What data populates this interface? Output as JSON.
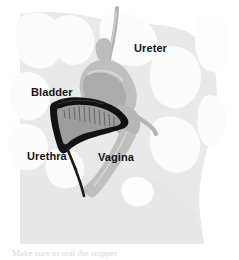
{
  "figure": {
    "name": "female-pelvic-anatomy-sagittal",
    "caption_partial": "Make sure to seal the stopper"
  },
  "labels": {
    "ureter": "Ureter",
    "bladder": "Bladder",
    "urethra": "Urethra",
    "vagina": "Vagina"
  },
  "colors": {
    "page_background": "#ffffff",
    "body_tissue": "#e8e8e8",
    "bone_light": "#f4f4f4",
    "organ_gray": "#bdbdbd",
    "organ_gray_dark": "#a8a8a8",
    "bladder_outline": "#111111",
    "bladder_lining": "#9a9a9a",
    "ureter_tube": "#b0b0b0",
    "label_text": "#141414",
    "caption_text": "#d8d8d8"
  },
  "structures": [
    {
      "id": "ureter",
      "label": "Ureter",
      "kind": "tube",
      "color": "#b0b0b0"
    },
    {
      "id": "bladder",
      "label": "Bladder",
      "kind": "organ",
      "color": "#111111"
    },
    {
      "id": "urethra",
      "label": "Urethra",
      "kind": "tube",
      "color": "#1a1a1a"
    },
    {
      "id": "vagina",
      "label": "Vagina",
      "kind": "canal",
      "color": "#bdbdbd"
    },
    {
      "id": "uterus",
      "label": "",
      "kind": "organ",
      "color": "#bdbdbd"
    }
  ]
}
